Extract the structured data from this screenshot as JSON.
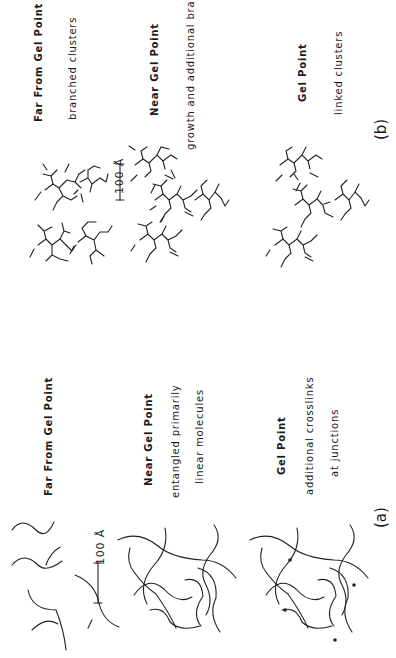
{
  "figure": {
    "orientation": "rotated 90 degrees counter-clockwise",
    "panel_a": {
      "label": "(a)",
      "scale_bar": "100 Å",
      "stages": [
        {
          "title": "Far From Gel Point",
          "lines": []
        },
        {
          "title": "Near Gel Point",
          "lines": [
            "entangled primarily",
            "linear molecules"
          ]
        },
        {
          "title": "Gel Point",
          "lines": [
            "additional crosslinks",
            "at junctions"
          ]
        }
      ]
    },
    "panel_b": {
      "label": "(b)",
      "scale_bar": "100 Å",
      "stages": [
        {
          "title": "Far From Gel Point",
          "lines": [
            "branched clusters"
          ]
        },
        {
          "title": "Near Gel Point",
          "lines": [
            "growth and additional branching"
          ]
        },
        {
          "title": "Gel Point",
          "lines": [
            "linked clusters"
          ]
        }
      ]
    }
  }
}
